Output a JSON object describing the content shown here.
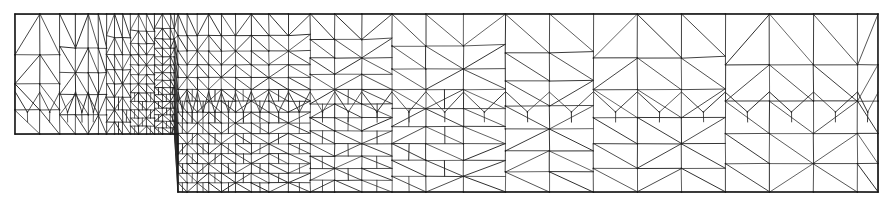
{
  "figure": {
    "kind": "finite-element-mesh",
    "title": "Graded triangular finite element mesh on a stepped (L-shaped) domain",
    "width": 893,
    "height": 208,
    "background_color": "#ffffff",
    "line_color": "#2b2b2b",
    "boundary_color": "#1a1a1a",
    "node_color": "#1a1a1a",
    "line_width": 1.0,
    "boundary_width": 1.4,
    "style": "scanned print, grayscale line drawing, no axes, no labels, no legend"
  },
  "domain": {
    "description": "Long horizontal strip with a downward step; upper band spans the full width, lower band begins after the reentrant step corner and extends to the right edge",
    "outline_points": [
      [
        15,
        14
      ],
      [
        878,
        14
      ],
      [
        878,
        192
      ],
      [
        178,
        192
      ],
      [
        178,
        134
      ],
      [
        15,
        134
      ],
      [
        15,
        14
      ]
    ],
    "upper_band": {
      "x0": 15,
      "x1": 878,
      "y0": 14,
      "y1": 134
    },
    "lower_band": {
      "x0": 178,
      "x1": 878,
      "y0": 134,
      "y1": 192
    },
    "reentrant_corner": {
      "x": 178,
      "y": 134
    }
  },
  "mesh_data": {
    "type": "triangular-mesh",
    "grading": "strong refinement toward the step / reentrant corner region; coarsening toward the far left and far right",
    "diagonal_pattern": "each quadrilateral cell split by one diagonal, mostly lower-left to upper-right",
    "upper_band_rows": [
      {
        "label": "row-1",
        "y_top": 14,
        "y_bottom": 37,
        "columns": 34
      },
      {
        "label": "row-2",
        "y_top": 37,
        "y_bottom": 62,
        "columns": 34
      },
      {
        "label": "row-3",
        "y_top": 62,
        "y_bottom": 92,
        "columns": 34
      },
      {
        "label": "row-4-transition",
        "y_top": 92,
        "y_bottom": 110,
        "columns": 34,
        "note": "fan / V-shaped transition triangles connecting coarse upper rows to fine lower mesh"
      }
    ],
    "fine_zone": {
      "x_start": 110,
      "x_end": 470,
      "y_start": 100,
      "y_end": 192,
      "horizontal_layers": 15,
      "note": "densest region, immediately right of and below the step corner"
    },
    "column_grading_x": [
      15,
      46,
      78,
      110,
      126,
      142,
      155,
      167,
      178,
      188,
      197,
      206,
      214,
      222,
      230,
      238,
      246,
      254,
      262,
      270,
      279,
      288,
      297,
      306,
      316,
      326,
      337,
      348,
      360,
      373,
      387,
      402,
      418,
      436,
      455,
      476,
      499,
      524,
      551,
      580,
      611,
      644,
      679,
      716,
      755,
      796,
      838,
      878
    ],
    "upper_row_y": [
      14,
      37,
      62,
      92,
      112,
      134
    ],
    "lower_row_y": [
      134,
      142,
      150,
      158,
      166,
      174,
      183,
      192
    ],
    "approx_element_count": 2400,
    "approx_node_count": 1300
  },
  "annotations": {
    "axis_labels": [],
    "tick_labels": [],
    "legend_entries": [],
    "text_labels": []
  }
}
